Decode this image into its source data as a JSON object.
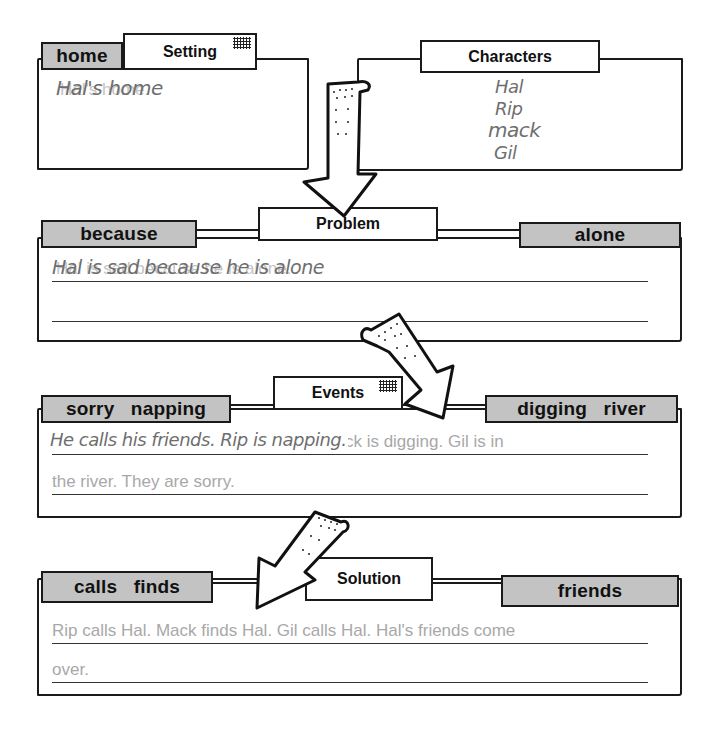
{
  "setting": {
    "title": "Setting",
    "word": "home",
    "handwritten": "Hal's home",
    "typed": "Hal's home."
  },
  "characters": {
    "title": "Characters",
    "handwritten_lines": [
      "Hal",
      "Rip",
      "mack",
      "Gil"
    ]
  },
  "problem": {
    "title": "Problem",
    "words": [
      "because",
      "alone"
    ],
    "typed": "Hal is sad because he is alone.",
    "handwritten": "Hal is sad because he is alone"
  },
  "events": {
    "title": "Events",
    "words": [
      "sorry   napping",
      "digging   river"
    ],
    "typed_line1": "He calls his friends. Rip is napping. Mack is digging. Gil is in",
    "typed_line2": "the river. They are sorry.",
    "handwritten": "He calls his friends. Rip is napping."
  },
  "solution": {
    "title": "Solution",
    "words": [
      "calls   finds",
      "friends"
    ],
    "typed_line1": "Rip calls Hal. Mack finds Hal. Gil calls Hal. Hal's friends come",
    "typed_line2": "over."
  },
  "colors": {
    "label_fill": "#c3c3c3",
    "typed_text": "#a8a8a8",
    "handwriting": "#6e6e6e",
    "ink": "#1a1a1a"
  }
}
